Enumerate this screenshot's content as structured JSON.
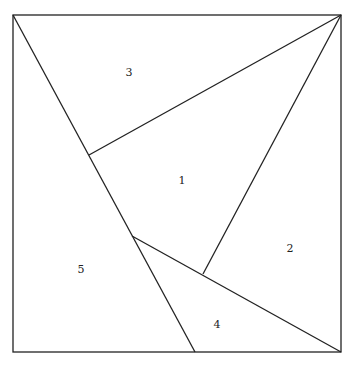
{
  "diagram": {
    "square": {
      "x": 13,
      "y": 15,
      "w": 328,
      "h": 337
    },
    "segments": [
      {
        "name": "diagonal-left",
        "x1": 13,
        "y1": 15,
        "x2": 195,
        "y2": 352
      },
      {
        "name": "line-to-top-right-from-left",
        "x1": 89,
        "y1": 155,
        "x2": 341,
        "y2": 15
      },
      {
        "name": "line-to-top-right-from-bottom",
        "x1": 203,
        "y1": 274,
        "x2": 341,
        "y2": 15
      },
      {
        "name": "line-to-bottom-right",
        "x1": 132,
        "y1": 236,
        "x2": 341,
        "y2": 352
      }
    ],
    "regions": [
      {
        "label": "1",
        "x": 182,
        "y": 184
      },
      {
        "label": "2",
        "x": 290,
        "y": 252
      },
      {
        "label": "3",
        "x": 129,
        "y": 76
      },
      {
        "label": "4",
        "x": 217,
        "y": 328
      },
      {
        "label": "5",
        "x": 81,
        "y": 273
      }
    ]
  }
}
